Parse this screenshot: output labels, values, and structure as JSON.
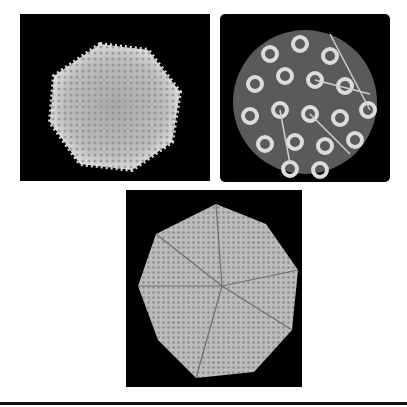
{
  "figure": {
    "panels": [
      {
        "id": "top-left",
        "subject": "icosahedral virus capsid, spiky surface rendering",
        "background": "#000000",
        "particle_color": "#cfcfcf"
      },
      {
        "id": "top-right",
        "subject": "virus capsid with ring-shaped surface proteins and fibers",
        "background": "#000000",
        "particle_color": "#d8d8d8"
      },
      {
        "id": "bottom",
        "subject": "icosahedral virus capsid, granular surface rendering",
        "background": "#000000",
        "particle_color": "#c8c8c8"
      }
    ],
    "rule_color": "#111111"
  }
}
